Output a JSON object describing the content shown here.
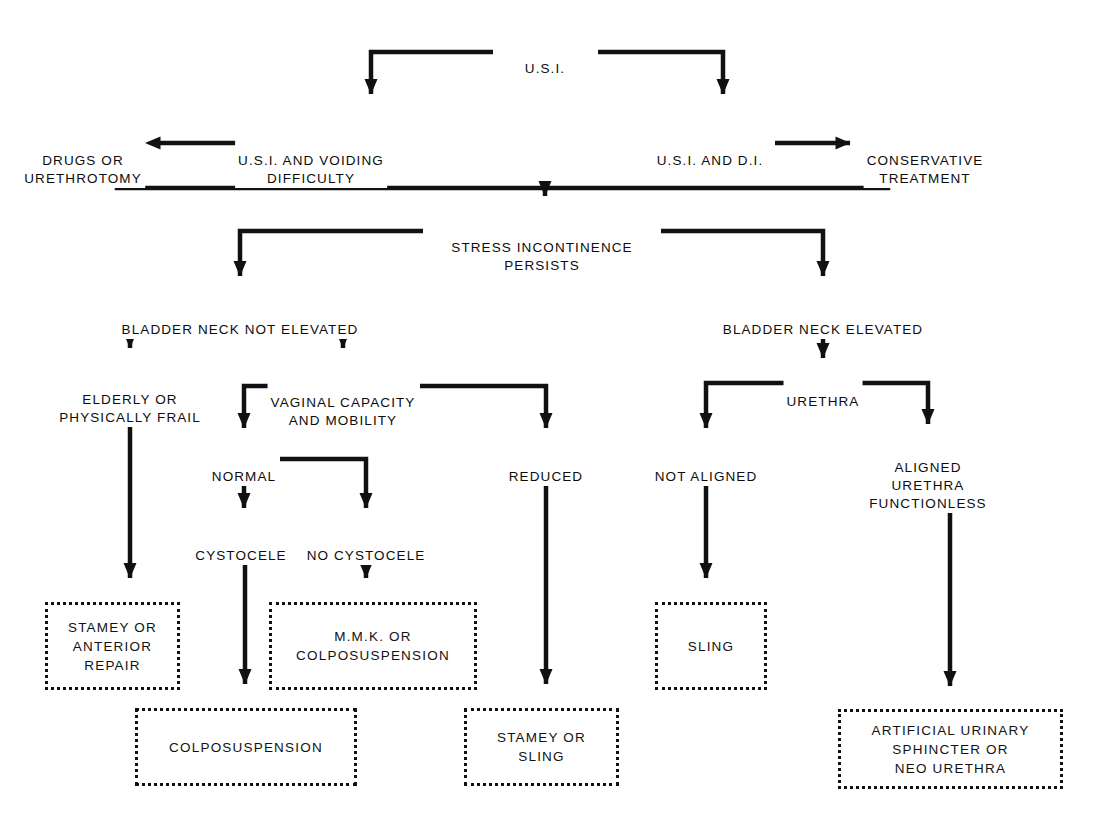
{
  "diagram": {
    "type": "flowchart",
    "ink_color": "#111111",
    "background_color": "#ffffff",
    "nodes": [
      {
        "id": "usi",
        "label": "U.S.I.",
        "x": 545,
        "y": 42,
        "kind": "text"
      },
      {
        "id": "usi_voiding",
        "label": "U.S.I. AND VOIDING\nDIFFICULTY",
        "x": 311,
        "y": 134,
        "kind": "text"
      },
      {
        "id": "drugs",
        "label": "DRUGS OR\nURETHROTOMY",
        "x": 83,
        "y": 134,
        "kind": "text"
      },
      {
        "id": "usi_di",
        "label": "U.S.I. AND D.I.",
        "x": 710,
        "y": 143,
        "kind": "text"
      },
      {
        "id": "conservative",
        "label": "CONSERVATIVE\nTREATMENT",
        "x": 925,
        "y": 134,
        "kind": "text"
      },
      {
        "id": "stress_persists",
        "label": "STRESS INCONTINENCE\nPERSISTS",
        "x": 542,
        "y": 221,
        "kind": "text"
      },
      {
        "id": "bn_not_elevated",
        "label": "BLADDER NECK NOT ELEVATED",
        "x": 240,
        "y": 303,
        "kind": "text"
      },
      {
        "id": "bn_elevated",
        "label": "BLADDER NECK ELEVATED",
        "x": 823,
        "y": 303,
        "kind": "text"
      },
      {
        "id": "elderly",
        "label": "ELDERLY OR\nPHYSICALLY FRAIL",
        "x": 130,
        "y": 373,
        "kind": "text"
      },
      {
        "id": "vaginal_capacity",
        "label": "VAGINAL CAPACITY\nAND MOBILITY",
        "x": 343,
        "y": 376,
        "kind": "text"
      },
      {
        "id": "urethra",
        "label": "URETHRA",
        "x": 823,
        "y": 383,
        "kind": "text"
      },
      {
        "id": "normal",
        "label": "NORMAL",
        "x": 244,
        "y": 457,
        "kind": "text"
      },
      {
        "id": "reduced",
        "label": "REDUCED",
        "x": 546,
        "y": 457,
        "kind": "text"
      },
      {
        "id": "not_aligned",
        "label": "NOT ALIGNED",
        "x": 706,
        "y": 457,
        "kind": "text"
      },
      {
        "id": "aligned_functionless",
        "label": "ALIGNED\nURETHRA FUNCTIONLESS",
        "x": 928,
        "y": 448,
        "kind": "text"
      },
      {
        "id": "cystocele",
        "label": "CYSTOCELE",
        "x": 241,
        "y": 536,
        "kind": "text"
      },
      {
        "id": "no_cystocele",
        "label": "NO CYSTOCELE",
        "x": 366,
        "y": 536,
        "kind": "text"
      }
    ],
    "boxes": [
      {
        "id": "box_stamey_anterior",
        "label": "STAMEY OR\nANTERIOR\nREPAIR",
        "x": 45,
        "y": 602,
        "w": 135,
        "h": 88
      },
      {
        "id": "box_mmk",
        "label": "M.M.K. OR\nCOLPOSUSPENSION",
        "x": 269,
        "y": 602,
        "w": 208,
        "h": 88
      },
      {
        "id": "box_colposuspension",
        "label": "COLPOSUSPENSION",
        "x": 135,
        "y": 708,
        "w": 222,
        "h": 78
      },
      {
        "id": "box_stamey_sling",
        "label": "STAMEY OR\nSLING",
        "x": 464,
        "y": 708,
        "w": 155,
        "h": 78
      },
      {
        "id": "box_sling",
        "label": "SLING",
        "x": 655,
        "y": 602,
        "w": 112,
        "h": 88
      },
      {
        "id": "box_artificial",
        "label": "ARTIFICIAL URINARY\nSPHINCTER OR\nNEO URETHRA",
        "x": 838,
        "y": 709,
        "w": 225,
        "h": 80
      }
    ],
    "edges": [
      {
        "from": "usi",
        "to": "usi_voiding",
        "style": "elbow-down-left"
      },
      {
        "from": "usi",
        "to": "usi_di",
        "style": "elbow-down-right"
      },
      {
        "from": "usi_voiding",
        "to": "drugs",
        "style": "arrow-left"
      },
      {
        "from": "usi_di",
        "to": "conservative",
        "style": "arrow-right"
      },
      {
        "from": "drugs+conservative",
        "to": "stress_persists",
        "style": "merge-bus-down"
      },
      {
        "from": "stress_persists",
        "to": "bn_not_elevated",
        "style": "elbow-down-left"
      },
      {
        "from": "stress_persists",
        "to": "bn_elevated",
        "style": "elbow-down-right"
      },
      {
        "from": "bn_not_elevated",
        "to": "elderly",
        "style": "arrow-down"
      },
      {
        "from": "bn_not_elevated",
        "to": "vaginal_capacity",
        "style": "arrow-down"
      },
      {
        "from": "bn_elevated",
        "to": "urethra",
        "style": "arrow-down"
      },
      {
        "from": "vaginal_capacity",
        "to": "normal",
        "style": "elbow-down-left"
      },
      {
        "from": "vaginal_capacity",
        "to": "reduced",
        "style": "elbow-down-right"
      },
      {
        "from": "urethra",
        "to": "not_aligned",
        "style": "elbow-down-left"
      },
      {
        "from": "urethra",
        "to": "aligned_functionless",
        "style": "elbow-down-right"
      },
      {
        "from": "normal",
        "to": "cystocele",
        "style": "arrow-down"
      },
      {
        "from": "normal",
        "to": "no_cystocele",
        "style": "elbow-down-right"
      },
      {
        "from": "elderly",
        "to": "box_stamey_anterior",
        "style": "arrow-down"
      },
      {
        "from": "no_cystocele",
        "to": "box_mmk",
        "style": "arrow-down"
      },
      {
        "from": "cystocele",
        "to": "box_colposuspension",
        "style": "arrow-down"
      },
      {
        "from": "reduced",
        "to": "box_stamey_sling",
        "style": "arrow-down"
      },
      {
        "from": "not_aligned",
        "to": "box_sling",
        "style": "arrow-down"
      },
      {
        "from": "aligned_functionless",
        "to": "box_artificial",
        "style": "arrow-down"
      }
    ]
  }
}
